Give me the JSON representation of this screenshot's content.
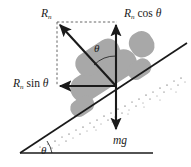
{
  "figure": {
    "type": "physics-free-body-diagram",
    "background_color": "#ffffff",
    "vehicle_color": "#a8a8a8",
    "line_color": "#1a1a1a",
    "dashed_color": "#555555"
  },
  "labels": {
    "resultant": {
      "symbol": "R",
      "subscript": "n",
      "text": "R"
    },
    "normal_vertical": {
      "symbol": "R",
      "subscript": "n",
      "function": "cos",
      "angle": "θ"
    },
    "normal_horizontal": {
      "symbol": "R",
      "subscript": "n",
      "function": "sin",
      "angle": "θ"
    },
    "weight": {
      "text": "mg"
    },
    "angle_vector": {
      "text": "θ"
    },
    "angle_incline": {
      "text": "θ"
    }
  },
  "vectors": [
    {
      "name": "resultant-normal-force",
      "label": "R_n",
      "origin": [
        116,
        86
      ],
      "tip": [
        57,
        22
      ],
      "direction": "up-left",
      "style": "solid"
    },
    {
      "name": "vertical-component",
      "label": "R_n cos θ",
      "origin": [
        116,
        86
      ],
      "tip": [
        116,
        22
      ],
      "direction": "up",
      "style": "solid"
    },
    {
      "name": "horizontal-component",
      "label": "R_n sin θ",
      "origin": [
        116,
        86
      ],
      "tip": [
        57,
        86
      ],
      "direction": "left",
      "style": "solid"
    },
    {
      "name": "weight-force",
      "label": "mg",
      "origin": [
        116,
        86
      ],
      "tip": [
        116,
        132
      ],
      "direction": "down",
      "style": "solid"
    }
  ],
  "construction_lines": {
    "style": "dashed",
    "segments": [
      {
        "name": "top-dashed",
        "from": [
          57,
          22
        ],
        "to": [
          116,
          22
        ]
      },
      {
        "name": "left-dashed",
        "from": [
          57,
          22
        ],
        "to": [
          57,
          86
        ]
      }
    ]
  },
  "incline": {
    "name": "inclined-plane",
    "surface_from": [
      22,
      152
    ],
    "surface_to": [
      186,
      44
    ],
    "baseline_from": [
      22,
      152
    ],
    "baseline_to": [
      152,
      152
    ],
    "hatching": "stippled-dots",
    "angle_symbol": "θ"
  },
  "vehicle": {
    "name": "vehicle-on-incline",
    "color": "#a8a8a8",
    "parts": [
      {
        "part": "body",
        "shape": "rounded-rect"
      },
      {
        "part": "cabin",
        "shape": "rounded-rect"
      },
      {
        "part": "front-wheel",
        "shape": "rounded-rect"
      },
      {
        "part": "rear-wheel",
        "shape": "rounded-rect"
      },
      {
        "part": "nose",
        "shape": "rounded-rect"
      }
    ]
  }
}
